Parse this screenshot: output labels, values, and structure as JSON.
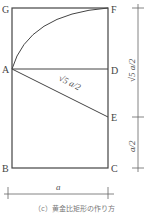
{
  "diagram": {
    "points": {
      "G": "G",
      "F": "F",
      "A": "A",
      "D": "D",
      "E": "E",
      "B": "B",
      "C": "C"
    },
    "diagonal_label": "√5 a/2",
    "right_dim_upper": "√5 a/2",
    "right_dim_lower": "a/2",
    "bottom_dim": "a",
    "caption": "（c）黄金比矩形の作り方",
    "colors": {
      "stroke": "#444444",
      "dim_stroke": "#666666"
    }
  }
}
